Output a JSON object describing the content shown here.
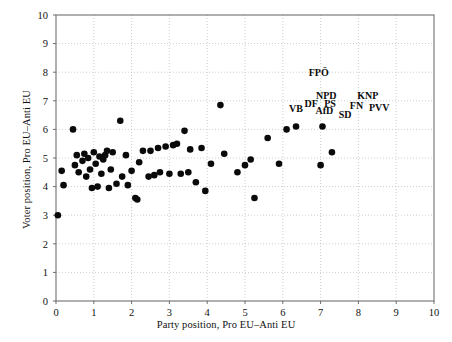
{
  "chart_data": {
    "type": "scatter",
    "title": "",
    "xlabel": "Party position, Pro EU–Anti EU",
    "ylabel": "Voter position, Pro EU–Anti EU",
    "xlim": [
      0,
      10
    ],
    "ylim": [
      0,
      10
    ],
    "xticks": [
      0,
      1,
      2,
      3,
      4,
      5,
      6,
      7,
      8,
      9,
      10
    ],
    "yticks": [
      0,
      1,
      2,
      3,
      4,
      5,
      6,
      7,
      8,
      9,
      10
    ],
    "xticklabels": [
      "0",
      "1",
      "2",
      "3",
      "4",
      "5",
      "6",
      "7",
      "8",
      "9",
      "10"
    ],
    "yticklabels": [
      "0",
      "1",
      "2",
      "3",
      "4",
      "5",
      "6",
      "7",
      "8",
      "9",
      "10"
    ],
    "grid": true,
    "legend": "none",
    "marker": "filled-circle",
    "marker_color": "#0a0a0a",
    "points": [
      [
        0.05,
        3.0
      ],
      [
        0.15,
        4.55
      ],
      [
        0.2,
        4.05
      ],
      [
        0.45,
        6.0
      ],
      [
        0.5,
        4.75
      ],
      [
        0.55,
        5.1
      ],
      [
        0.6,
        4.5
      ],
      [
        0.7,
        4.9
      ],
      [
        0.75,
        5.15
      ],
      [
        0.8,
        4.35
      ],
      [
        0.85,
        5.0
      ],
      [
        0.9,
        4.6
      ],
      [
        0.95,
        3.95
      ],
      [
        1.0,
        5.2
      ],
      [
        1.05,
        4.8
      ],
      [
        1.1,
        4.0
      ],
      [
        1.15,
        5.05
      ],
      [
        1.2,
        4.45
      ],
      [
        1.25,
        4.95
      ],
      [
        1.3,
        5.1
      ],
      [
        1.35,
        5.25
      ],
      [
        1.4,
        3.95
      ],
      [
        1.45,
        4.6
      ],
      [
        1.5,
        5.2
      ],
      [
        1.6,
        4.1
      ],
      [
        1.7,
        6.3
      ],
      [
        1.75,
        4.35
      ],
      [
        1.85,
        5.1
      ],
      [
        1.9,
        4.05
      ],
      [
        2.0,
        4.55
      ],
      [
        2.1,
        3.6
      ],
      [
        2.15,
        3.55
      ],
      [
        2.2,
        4.85
      ],
      [
        2.3,
        5.25
      ],
      [
        2.45,
        4.35
      ],
      [
        2.5,
        5.25
      ],
      [
        2.6,
        4.4
      ],
      [
        2.7,
        5.35
      ],
      [
        2.75,
        4.5
      ],
      [
        2.9,
        5.4
      ],
      [
        3.0,
        4.45
      ],
      [
        3.1,
        5.45
      ],
      [
        3.2,
        5.5
      ],
      [
        3.3,
        4.45
      ],
      [
        3.4,
        5.95
      ],
      [
        3.5,
        4.5
      ],
      [
        3.55,
        5.3
      ],
      [
        3.7,
        4.15
      ],
      [
        3.85,
        5.35
      ],
      [
        3.95,
        3.85
      ],
      [
        4.1,
        4.8
      ],
      [
        4.35,
        6.85
      ],
      [
        4.45,
        5.15
      ],
      [
        4.8,
        4.5
      ],
      [
        5.0,
        4.75
      ],
      [
        5.15,
        4.95
      ],
      [
        5.25,
        3.6
      ],
      [
        5.6,
        5.7
      ],
      [
        5.9,
        4.8
      ],
      [
        6.1,
        6.0
      ],
      [
        6.35,
        6.1
      ],
      [
        7.05,
        6.1
      ],
      [
        7.0,
        4.75
      ],
      [
        7.3,
        5.2
      ]
    ],
    "annotations": [
      {
        "text": "FPÖ",
        "x": 6.95,
        "y": 7.85
      },
      {
        "text": "VB",
        "x": 6.35,
        "y": 6.6
      },
      {
        "text": "NPD",
        "x": 7.15,
        "y": 7.05
      },
      {
        "text": "DF",
        "x": 6.75,
        "y": 6.8
      },
      {
        "text": "PS",
        "x": 7.25,
        "y": 6.8
      },
      {
        "text": "KNP",
        "x": 8.25,
        "y": 7.05
      },
      {
        "text": "AfD",
        "x": 7.1,
        "y": 6.55
      },
      {
        "text": "FN",
        "x": 7.95,
        "y": 6.7
      },
      {
        "text": "PVV",
        "x": 8.55,
        "y": 6.65
      },
      {
        "text": "SD",
        "x": 7.65,
        "y": 6.4
      }
    ]
  }
}
